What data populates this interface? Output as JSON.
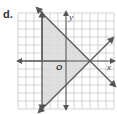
{
  "problem_label": "d.",
  "graph": {
    "x_axis_label": "x",
    "y_axis_label": "y",
    "origin_label": "O",
    "grid": {
      "cols": 12,
      "rows": 12,
      "x_range": [
        -6,
        6
      ],
      "y_range": [
        -6,
        6
      ]
    },
    "lines": [
      {
        "name": "vertical-line",
        "equation": "x = -3"
      },
      {
        "name": "decreasing-line",
        "equation": "y = -x + 3"
      },
      {
        "name": "increasing-line",
        "equation": "y = x - 3"
      }
    ],
    "shaded_region": {
      "vertices": [
        [
          -3,
          6
        ],
        [
          -3,
          -6
        ],
        [
          3,
          0
        ]
      ]
    },
    "colors": {
      "grid": "#c8c8c8",
      "lines": "#555555",
      "shade": "#d9d9d9"
    }
  }
}
